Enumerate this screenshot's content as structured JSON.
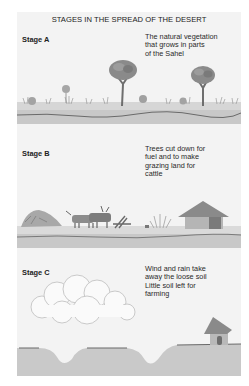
{
  "title": "STAGES IN THE SPREAD OF THE DESERT",
  "stages": [
    {
      "label": "Stage A",
      "description_lines": [
        "The natural vegetation",
        "that grows in parts",
        "of the Sahel"
      ],
      "illustration": "savanna with acacia trees, bushes and grass on soil strip"
    },
    {
      "label": "Stage B",
      "description_lines": [
        "Trees cut down for",
        "fuel and to make",
        "grazing land for",
        "cattle"
      ],
      "illustration": "felled tree, grazing cattle, chopped wood, dry shrub and round thatched hut on soil strip"
    },
    {
      "label": "Stage C",
      "description_lines": [
        "Wind and rain take",
        "away the loose soil",
        "Little soil left for",
        "farming"
      ],
      "illustration": "dust cloud over eroded ground with gullies and a small hut on the edge"
    }
  ],
  "colors": {
    "page_background": "#ffffff",
    "panel_background": "#f3f3f3",
    "soil": "#c9c9c9",
    "soil_line": "#6a6a6a",
    "vegetation": "#8a8a8a"
  }
}
